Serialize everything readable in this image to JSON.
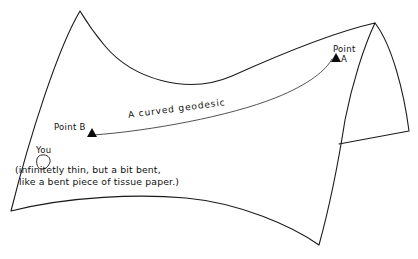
{
  "figure": {
    "title_alt": "Curved saddle surface with a geodesic between two points",
    "background_color": "#ffffff",
    "ink_color": "#111111"
  },
  "labels": {
    "point_b": "Point B",
    "point_a_line1": "Point",
    "point_a_line2": "A",
    "geodesic": "A curved geodesic",
    "you": "You",
    "caption_line1": "(infinitetly thin, but a bit bent,",
    "caption_line2": "like a bent piece of tissue paper.)"
  },
  "markers": {
    "point_a": {
      "name": "triangle-marker",
      "x": 331,
      "y": 61
    },
    "point_b": {
      "name": "triangle-marker",
      "x": 92,
      "y": 134
    }
  },
  "geodesic": {
    "start": {
      "x": 93,
      "y": 135
    },
    "end": {
      "x": 332,
      "y": 59
    },
    "stroke": "#333333"
  },
  "surface": {
    "stroke": "#1a1a1a",
    "vertices": {
      "top_left_peak": {
        "x": 80,
        "y": 11
      },
      "top_right_peak": {
        "x": 375,
        "y": 23
      },
      "bottom_left": {
        "x": 11,
        "y": 211
      },
      "bottom_right": {
        "x": 319,
        "y": 245
      },
      "saddle_low_point": {
        "x": 232,
        "y": 76
      },
      "bottom_arc_high_point": {
        "x": 186,
        "y": 198
      }
    }
  },
  "flap": {
    "stroke": "#1a1a1a",
    "vertices": {
      "apex": {
        "x": 375,
        "y": 23
      },
      "outer_bottom": {
        "x": 409,
        "y": 131
      },
      "inner_bottom": {
        "x": 339,
        "y": 144
      }
    }
  },
  "blob": {
    "name": "you-blob",
    "center": {
      "x": 44,
      "y": 162
    }
  }
}
